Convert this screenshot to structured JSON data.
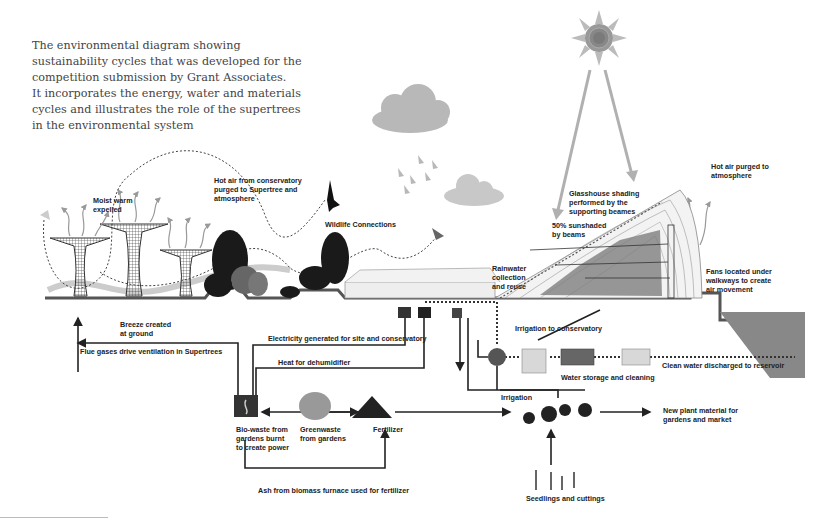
{
  "caption": {
    "lines": [
      "The environmental diagram showing",
      "sustainability cycles that was developed for the",
      "competition submission by Grant Associates.",
      "It incorporates the energy, water and materials",
      "cycles and illustrates the role of the supertrees",
      "in the environmental system"
    ]
  },
  "labels": {
    "moist_warm": [
      "Moist warm",
      "expelled"
    ],
    "hot_air_conservatory": [
      "Hot air from conservatory",
      "purged to Supertree and",
      "atmosphere"
    ],
    "wildlife": "Wildlife Connections",
    "breeze": [
      "Breeze created",
      "at ground"
    ],
    "flue_gases": "Flue gases drive ventilation in Supertrees",
    "electricity": "Electricity generated for site and conservatory",
    "heat_dehumidifier": "Heat for dehumidifier",
    "biowaste": [
      "Bio-waste from",
      "gardens burnt",
      "to create power"
    ],
    "greenwaste": [
      "Greenwaste",
      "from gardens"
    ],
    "fertilizer": "Fertilizer",
    "ash": "Ash from biomass furnace used for fertilizer",
    "glasshouse_shading": [
      "Glasshouse shading",
      "performed by the",
      "supporting beames"
    ],
    "sunshaded": [
      "50% sunshaded",
      "by beams"
    ],
    "hot_air_purged": [
      "Hot air purged to",
      "atmosphere"
    ],
    "rainwater": [
      "Rainwater",
      "collection",
      "and reuse"
    ],
    "fans": [
      "Fans located under",
      "walkways to create",
      "air movement"
    ],
    "irrigation_conservatory": "Irrigation to conservatory",
    "water_storage": "Water storage and cleaning",
    "clean_water": "Clean water discharged to reservoir",
    "irrigation": "Irrigation",
    "new_plant": [
      "New plant material for",
      "gardens and market"
    ],
    "seedlings": "Seedlings and cuttings"
  },
  "colors": {
    "ink": "#222222",
    "cloud": "#b8b8b8",
    "sun_ray": "#b0b0b0",
    "ground": "#555555",
    "building": "#e8e8e8"
  }
}
